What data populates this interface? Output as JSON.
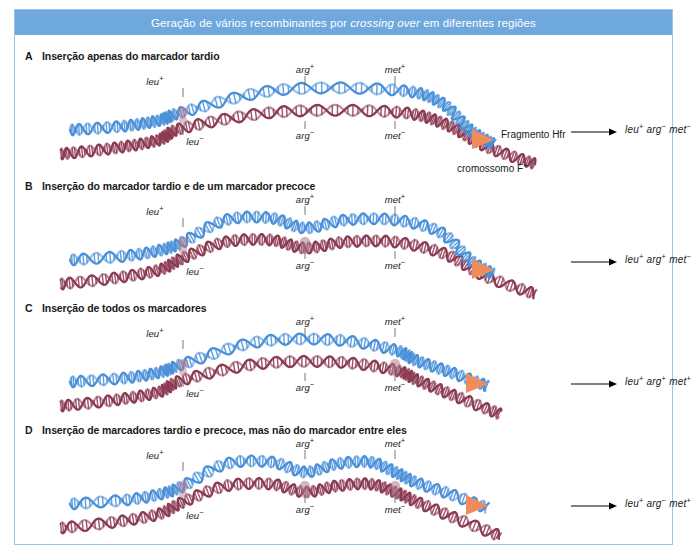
{
  "figure": {
    "header_title_pre": "Geração de vários recombinantes por ",
    "header_title_italic": "crossing over",
    "header_title_post": " em diferentes regiões",
    "header_bg": "#6fa8dc",
    "header_text_color": "#ffffff",
    "frame_border_color": "#9fc3e6",
    "caption": ""
  },
  "colors": {
    "hfr_strand": "#4a90d9",
    "f_minus_strand": "#8b3a52",
    "crossover_blend": "#b07b8e",
    "arrowhead": "#f08b5c",
    "result_arrow": "#000000"
  },
  "annotations": {
    "hfr_fragment_label": "Fragmento Hfr",
    "f_chromosome_label": "cromossomo F",
    "f_chromosome_sup": "−"
  },
  "panels": [
    {
      "letter": "A",
      "title": "Inserção apenas do marcador tardio",
      "crossover_genes": [
        "leu"
      ],
      "labels_top": [
        {
          "gene": "leu",
          "sign": "+"
        },
        {
          "gene": "arg",
          "sign": "+"
        },
        {
          "gene": "met",
          "sign": "+"
        }
      ],
      "labels_bottom": [
        {
          "gene": "leu",
          "sign": "−"
        },
        {
          "gene": "arg",
          "sign": "−"
        },
        {
          "gene": "met",
          "sign": "−"
        }
      ],
      "result": [
        {
          "gene": "leu",
          "sign": "+"
        },
        {
          "gene": "arg",
          "sign": "−"
        },
        {
          "gene": "met",
          "sign": "−"
        }
      ],
      "show_fragment_labels": true
    },
    {
      "letter": "B",
      "title": "Inserção do marcador tardio e de um marcador precoce",
      "crossover_genes": [
        "leu",
        "arg"
      ],
      "labels_top": [
        {
          "gene": "leu",
          "sign": "+"
        },
        {
          "gene": "arg",
          "sign": "+"
        },
        {
          "gene": "met",
          "sign": "+"
        }
      ],
      "labels_bottom": [
        {
          "gene": "leu",
          "sign": "−"
        },
        {
          "gene": "arg",
          "sign": "−"
        },
        {
          "gene": "met",
          "sign": "−"
        }
      ],
      "result": [
        {
          "gene": "leu",
          "sign": "+"
        },
        {
          "gene": "arg",
          "sign": "+"
        },
        {
          "gene": "met",
          "sign": "−"
        }
      ],
      "show_fragment_labels": false
    },
    {
      "letter": "C",
      "title": "Inserção de todos os marcadores",
      "crossover_genes": [
        "leu",
        "met"
      ],
      "labels_top": [
        {
          "gene": "leu",
          "sign": "+"
        },
        {
          "gene": "arg",
          "sign": "+"
        },
        {
          "gene": "met",
          "sign": "+"
        }
      ],
      "labels_bottom": [
        {
          "gene": "leu",
          "sign": "−"
        },
        {
          "gene": "arg",
          "sign": "−"
        },
        {
          "gene": "met",
          "sign": "−"
        }
      ],
      "result": [
        {
          "gene": "leu",
          "sign": "+"
        },
        {
          "gene": "arg",
          "sign": "+"
        },
        {
          "gene": "met",
          "sign": "+"
        }
      ],
      "show_fragment_labels": false
    },
    {
      "letter": "D",
      "title": "Inserção de marcadores tardio e precoce, mas não do marcador entre eles",
      "crossover_genes": [
        "leu",
        "arg",
        "met"
      ],
      "labels_top": [
        {
          "gene": "leu",
          "sign": "+"
        },
        {
          "gene": "arg",
          "sign": "+"
        },
        {
          "gene": "met",
          "sign": "+"
        }
      ],
      "labels_bottom": [
        {
          "gene": "leu",
          "sign": "−"
        },
        {
          "gene": "arg",
          "sign": "−"
        },
        {
          "gene": "met",
          "sign": "−"
        }
      ],
      "result": [
        {
          "gene": "leu",
          "sign": "+"
        },
        {
          "gene": "arg",
          "sign": "−"
        },
        {
          "gene": "met",
          "sign": "+"
        }
      ],
      "show_fragment_labels": false
    }
  ]
}
